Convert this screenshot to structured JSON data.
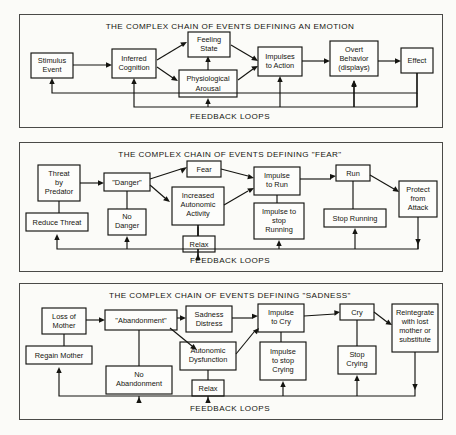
{
  "figure": {
    "feedback_label": "FEEDBACK LOOPS",
    "panels": [
      {
        "id": "emotion",
        "title": "THE COMPLEX CHAIN OF EVENTS DEFINING AN EMOTION",
        "nodes": [
          {
            "key": "stimulus",
            "lines": [
              "Stimulus",
              "Event"
            ]
          },
          {
            "key": "cognition",
            "lines": [
              "Inferred",
              "Cognition"
            ]
          },
          {
            "key": "feeling",
            "lines": [
              "Feeling",
              "State"
            ]
          },
          {
            "key": "arousal",
            "lines": [
              "Physiological",
              "Arousal"
            ]
          },
          {
            "key": "impulses",
            "lines": [
              "Impulses",
              "to Action"
            ]
          },
          {
            "key": "overt",
            "lines": [
              "Overt",
              "Behavior",
              "(displays)"
            ]
          },
          {
            "key": "effect",
            "lines": [
              "Effect"
            ]
          }
        ]
      },
      {
        "id": "fear",
        "title": "THE COMPLEX CHAIN OF EVENTS DEFINING \"FEAR\"",
        "nodes": [
          {
            "key": "threat",
            "lines": [
              "Threat",
              "by",
              "Predator"
            ]
          },
          {
            "key": "reduce",
            "lines": [
              "Reduce Threat"
            ]
          },
          {
            "key": "danger",
            "lines": [
              "\"Danger\""
            ]
          },
          {
            "key": "nodanger",
            "lines": [
              "No",
              "Danger"
            ]
          },
          {
            "key": "fear",
            "lines": [
              "Fear"
            ]
          },
          {
            "key": "increased",
            "lines": [
              "Increased",
              "Autonomic",
              "Activity"
            ]
          },
          {
            "key": "relax",
            "lines": [
              "Relax"
            ]
          },
          {
            "key": "impulserun",
            "lines": [
              "Impulse",
              "to Run"
            ]
          },
          {
            "key": "impulsestop",
            "lines": [
              "Impulse to",
              "stop",
              "Running"
            ]
          },
          {
            "key": "run",
            "lines": [
              "Run"
            ]
          },
          {
            "key": "stoprun",
            "lines": [
              "Stop Running"
            ]
          },
          {
            "key": "protect",
            "lines": [
              "Protect",
              "from",
              "Attack"
            ]
          }
        ]
      },
      {
        "id": "sadness",
        "title": "THE COMPLEX CHAIN OF EVENTS DEFINING \"SADNESS\"",
        "nodes": [
          {
            "key": "loss",
            "lines": [
              "Loss of",
              "Mother"
            ]
          },
          {
            "key": "regain",
            "lines": [
              "Regain Mother"
            ]
          },
          {
            "key": "abandon",
            "lines": [
              "\"Abandonment\""
            ]
          },
          {
            "key": "noabandon",
            "lines": [
              "No",
              "Abandonment"
            ]
          },
          {
            "key": "sadness",
            "lines": [
              "Sadness",
              "Distress"
            ]
          },
          {
            "key": "dysfunction",
            "lines": [
              "Autonomic",
              "Dysfunction"
            ]
          },
          {
            "key": "relax",
            "lines": [
              "Relax"
            ]
          },
          {
            "key": "impulsecry",
            "lines": [
              "Impulse",
              "to Cry"
            ]
          },
          {
            "key": "impulsestop",
            "lines": [
              "Impulse",
              "to stop",
              "Crying"
            ]
          },
          {
            "key": "cry",
            "lines": [
              "Cry"
            ]
          },
          {
            "key": "stopcry",
            "lines": [
              "Stop",
              "Crying"
            ]
          },
          {
            "key": "reintegrate",
            "lines": [
              "Reintegrate",
              "with lost",
              "mother or",
              "substitute"
            ]
          }
        ]
      }
    ]
  }
}
